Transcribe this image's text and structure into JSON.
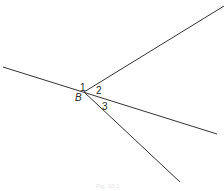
{
  "diagram": {
    "vertex": {
      "label": "B",
      "x": 84,
      "y": 92
    },
    "lines": [
      {
        "name": "transversal-line",
        "x1": 3,
        "y1": 67,
        "x2": 217,
        "y2": 134
      },
      {
        "name": "upper-ray",
        "x1": 84,
        "y1": 92,
        "x2": 224,
        "y2": 6
      },
      {
        "name": "lower-ray",
        "x1": 84,
        "y1": 92,
        "x2": 180,
        "y2": 182
      }
    ],
    "angle_labels": [
      {
        "text": "1",
        "x": 80,
        "y": 91
      },
      {
        "text": "2",
        "x": 97,
        "y": 94
      },
      {
        "text": "3",
        "x": 103,
        "y": 110
      }
    ],
    "line_color": "#333333",
    "caption": "Fig. 10.1"
  }
}
